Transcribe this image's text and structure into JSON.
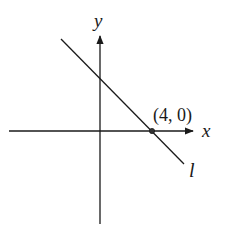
{
  "figure": {
    "type": "coordinate-plane",
    "axes": {
      "x_label": "x",
      "y_label": "y"
    },
    "line": {
      "label": "l",
      "slope_sign": "negative",
      "x_intercept_label": "(4, 0)"
    },
    "point": {
      "label": "(4, 0)",
      "x": 4,
      "y": 0
    },
    "colors": {
      "stroke": "#1a1a1a",
      "background": "#ffffff"
    }
  }
}
